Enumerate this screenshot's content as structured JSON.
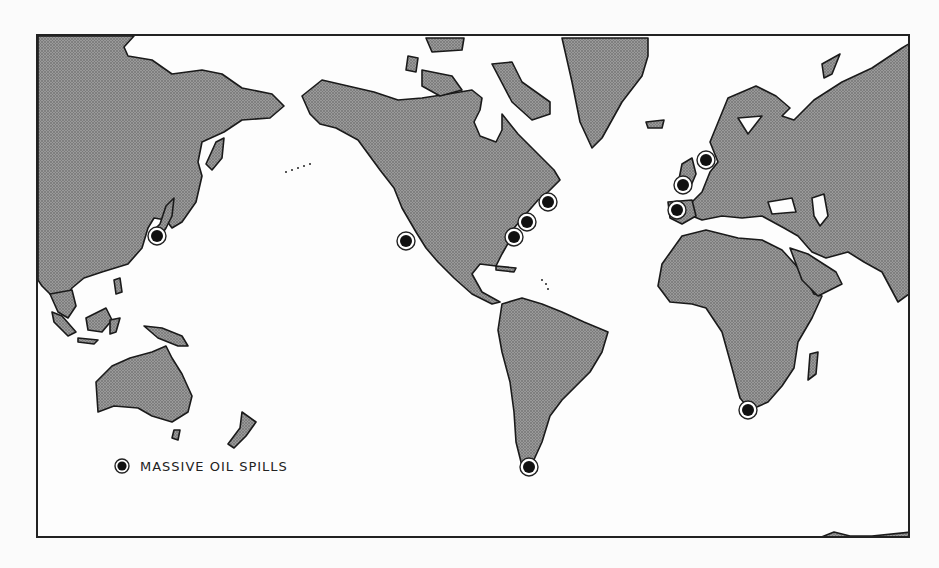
{
  "map": {
    "title": "",
    "projection": "world, Pacific-centered (Asia at left, Americas center, Europe/Africa right)",
    "legend": {
      "symbol": "marker-circle-dot",
      "label": "MASSIVE OIL SPILLS"
    },
    "colors": {
      "land": "#8a8a8a",
      "ocean": "#fdfdfd",
      "border": "#1a1a1a",
      "marker": "#111111"
    },
    "oil_spills": [
      {
        "region": "Japan",
        "x": 155,
        "y": 234
      },
      {
        "region": "Baja California / Southern California coast",
        "x": 404,
        "y": 239
      },
      {
        "region": "US East Coast (Carolina)",
        "x": 512,
        "y": 235
      },
      {
        "region": "US East Coast (Chesapeake)",
        "x": 525,
        "y": 220
      },
      {
        "region": "US Northeast (New England)",
        "x": 546,
        "y": 200
      },
      {
        "region": "North Sea / Netherlands",
        "x": 704,
        "y": 158
      },
      {
        "region": "English Channel / France",
        "x": 681,
        "y": 183
      },
      {
        "region": "Spain / Portugal (Galicia)",
        "x": 675,
        "y": 208
      },
      {
        "region": "Strait of Magellan, South America",
        "x": 527,
        "y": 465
      },
      {
        "region": "Cape of Good Hope, South Africa",
        "x": 746,
        "y": 408
      }
    ]
  }
}
